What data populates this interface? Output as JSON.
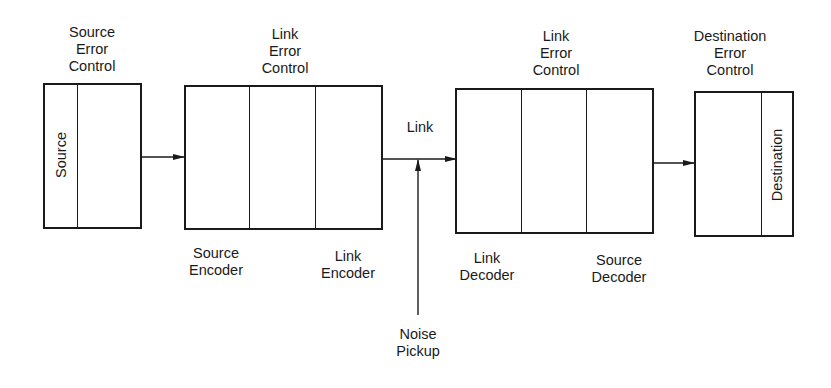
{
  "diagram": {
    "blocks": {
      "source": {
        "title": "Source\nError\nControl",
        "inner_label": "Source"
      },
      "encoder": {
        "title": "Link\nError\nControl",
        "bottom_left": "Source\nEncoder",
        "bottom_right": "Link\nEncoder"
      },
      "decoder": {
        "title": "Link\nError\nControl",
        "bottom_left": "Link\nDecoder",
        "bottom_right": "Source\nDecoder"
      },
      "destination": {
        "title": "Destination\nError\nControl",
        "inner_label": "Destination"
      }
    },
    "channel": {
      "link_label": "Link",
      "noise_label": "Noise\nPickup"
    },
    "colors": {
      "line": "#1a1a1a",
      "background": "#ffffff"
    }
  }
}
